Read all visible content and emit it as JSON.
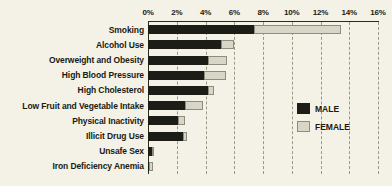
{
  "chart_data": {
    "type": "bar",
    "orientation": "horizontal",
    "stacked": true,
    "title": "",
    "xlabel": "",
    "ylabel": "",
    "xlim": [
      0,
      16
    ],
    "xunit": "%",
    "grid": true,
    "legend_position": "right",
    "xticks": [
      "0%",
      "2%",
      "4%",
      "6%",
      "8%",
      "10%",
      "12%",
      "14%",
      "16%"
    ],
    "xtick_values": [
      0,
      2,
      4,
      6,
      8,
      10,
      12,
      14,
      16
    ],
    "categories": [
      "Smoking",
      "Alcohol Use",
      "Overweight and Obesity",
      "High Blood Pressure",
      "High Cholesterol",
      "Low Fruit and Vegetable Intake",
      "Physical Inactivity",
      "Illicit Drug Use",
      "Unsafe Sex",
      "Iron Deficiency Anemia"
    ],
    "series": [
      {
        "name": "MALE",
        "color": "#1d1d17",
        "values": [
          7.4,
          5.1,
          4.2,
          3.9,
          4.2,
          2.6,
          2.1,
          2.4,
          0.25,
          0.1
        ]
      },
      {
        "name": "FEMALE",
        "color": "#d8d6c6",
        "values": [
          6.0,
          0.9,
          1.3,
          1.5,
          0.4,
          1.2,
          0.5,
          0.3,
          0.2,
          0.25
        ]
      }
    ]
  },
  "legend": {
    "items": [
      {
        "label": "MALE",
        "swatch": "male"
      },
      {
        "label": "FEMALE",
        "swatch": "female"
      }
    ]
  }
}
